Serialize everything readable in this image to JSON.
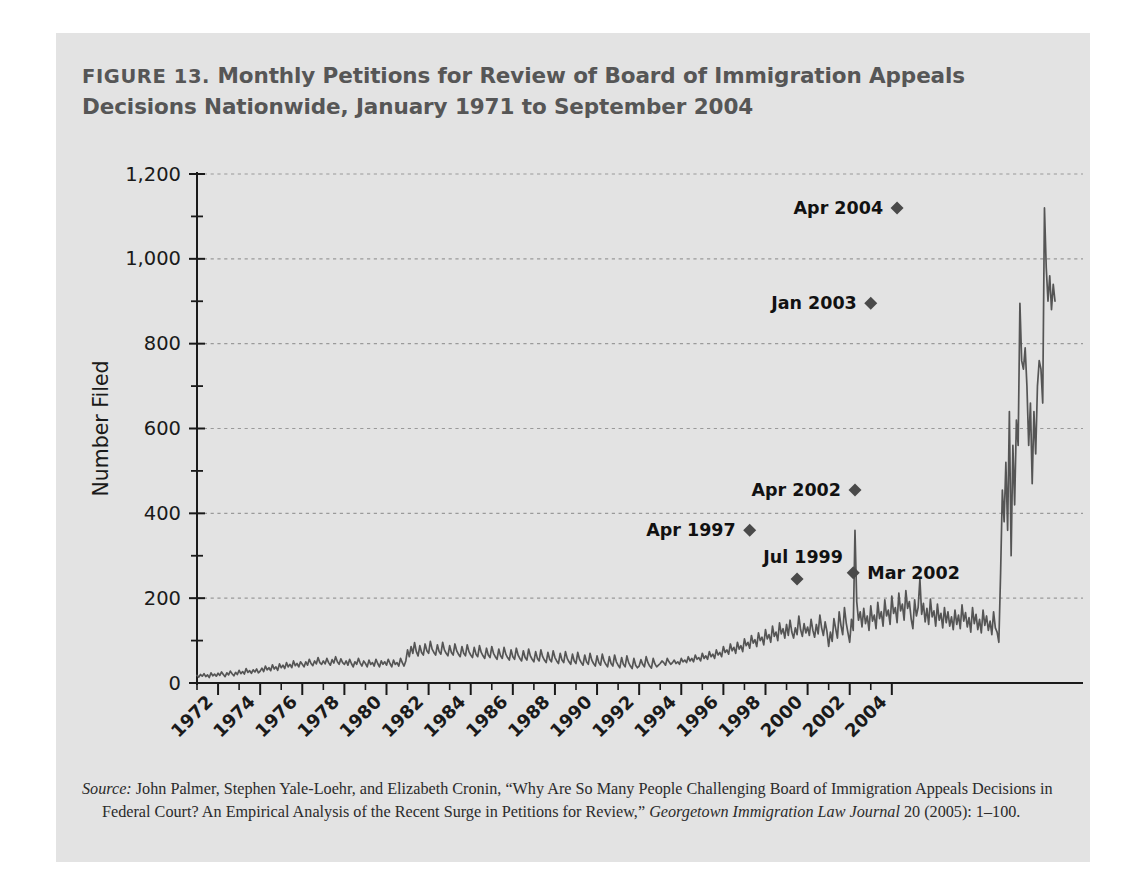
{
  "figure": {
    "label": "FIGURE 13.",
    "title_line1": "Monthly Petitions for Review of Board of Immigration Appeals",
    "title_line2": "Decisions Nationwide, January 1971 to September 2004",
    "title_full": "FIGURE 13. Monthly Petitions for Review of Board of Immigration Appeals Decisions Nationwide, January 1971 to September 2004"
  },
  "source": {
    "label": "Source:",
    "text_part1": " John Palmer, Stephen Yale-Loehr, and Elizabeth Cronin, “Why Are So Many People Challenging Board of Immigration Appeals Decisions in Federal Court? An Empirical Analysis of the Recent Surge in Petitions for Review,” ",
    "journal": "Georgetown Immigration Law Journal",
    "text_part2": " 20 (2005): 1–100."
  },
  "colors": {
    "page_background": "#ffffff",
    "panel_background": "#e3e3e3",
    "title_text": "#565656",
    "axis": "#1a1a1a",
    "gridline": "#9a9a9a",
    "series_line": "#555555",
    "marker": "#4a4a4a",
    "annotation_text": "#111111",
    "tick_label": "#1a1a1a",
    "source_text": "#2b2b2b"
  },
  "chart_data": {
    "type": "line",
    "title": "Monthly Petitions for Review of Board of Immigration Appeals Decisions Nationwide, January 1971 to September 2004",
    "xlabel": "",
    "ylabel": "Number Filed",
    "ylim": [
      0,
      1200
    ],
    "ytick_values": [
      0,
      200,
      400,
      600,
      800,
      1000,
      1200
    ],
    "ytick_labels": [
      "0",
      "200",
      "400",
      "600",
      "800",
      "1,000",
      "1,200"
    ],
    "yminor_tick_values": [
      100,
      300,
      500,
      700,
      900,
      1100
    ],
    "grid": "horizontal-dashed",
    "legend": "none",
    "xlim": [
      "1971-01",
      "2004-09"
    ],
    "xtick_labels": [
      "1972",
      "1974",
      "1976",
      "1978",
      "1980",
      "1982",
      "1984",
      "1986",
      "1988",
      "1990",
      "1992",
      "1994",
      "1996",
      "1998",
      "2000",
      "2002",
      "2004"
    ],
    "xtick_years": [
      1972,
      1974,
      1976,
      1978,
      1980,
      1982,
      1984,
      1986,
      1988,
      1990,
      1992,
      1994,
      1996,
      1998,
      2000,
      2002,
      2004
    ],
    "xminor_tick_years": [
      1971,
      1973,
      1975,
      1977,
      1979,
      1981,
      1983,
      1985,
      1987,
      1989,
      1991,
      1993,
      1995,
      1997,
      1999,
      2001,
      2003
    ],
    "x_tick_label_rotation_deg": 45,
    "annotations": [
      {
        "label": "Apr 1997",
        "x": "1997-04",
        "y": 360,
        "marker": "diamond",
        "label_side": "left"
      },
      {
        "label": "Jul 1999",
        "x": "1999-07",
        "y": 245,
        "marker": "diamond",
        "label_side": "above-left"
      },
      {
        "label": "Mar 2002",
        "x": "2002-03",
        "y": 260,
        "marker": "diamond",
        "label_side": "right"
      },
      {
        "label": "Apr 2002",
        "x": "2002-04",
        "y": 455,
        "marker": "diamond",
        "label_side": "left"
      },
      {
        "label": "Jan 2003",
        "x": "2003-01",
        "y": 895,
        "marker": "diamond",
        "label_side": "left"
      },
      {
        "label": "Apr 2004",
        "x": "2004-04",
        "y": 1120,
        "marker": "diamond",
        "label_side": "left"
      }
    ],
    "series": [
      {
        "name": "Petitions for Review Filed",
        "x_start": "1971-01",
        "x_step_months": 1,
        "values": [
          18,
          14,
          20,
          16,
          22,
          15,
          19,
          13,
          24,
          17,
          21,
          16,
          23,
          18,
          26,
          20,
          15,
          24,
          19,
          28,
          22,
          17,
          25,
          20,
          30,
          22,
          27,
          21,
          34,
          25,
          29,
          23,
          31,
          26,
          33,
          24,
          28,
          35,
          27,
          40,
          31,
          36,
          29,
          43,
          33,
          38,
          30,
          45,
          36,
          42,
          34,
          48,
          38,
          44,
          36,
          52,
          41,
          46,
          38,
          50,
          44,
          38,
          50,
          42,
          56,
          46,
          41,
          52,
          45,
          60,
          48,
          44,
          52,
          45,
          58,
          48,
          42,
          55,
          47,
          62,
          50,
          44,
          57,
          48,
          44,
          52,
          42,
          56,
          46,
          38,
          50,
          44,
          58,
          47,
          40,
          52,
          46,
          38,
          54,
          44,
          48,
          40,
          56,
          46,
          38,
          52,
          44,
          50,
          42,
          56,
          46,
          38,
          54,
          44,
          48,
          40,
          58,
          48,
          40,
          52,
          78,
          62,
          86,
          70,
          95,
          74,
          64,
          88,
          72,
          66,
          92,
          76,
          70,
          98,
          80,
          72,
          66,
          90,
          74,
          68,
          96,
          78,
          70,
          64,
          88,
          72,
          66,
          92,
          76,
          68,
          62,
          86,
          70,
          64,
          90,
          74,
          66,
          60,
          84,
          68,
          62,
          88,
          72,
          64,
          58,
          82,
          66,
          60,
          86,
          70,
          62,
          56,
          80,
          64,
          58,
          84,
          68,
          60,
          54,
          78,
          62,
          56,
          82,
          66,
          58,
          52,
          76,
          60,
          54,
          80,
          64,
          56,
          50,
          74,
          58,
          52,
          78,
          62,
          54,
          48,
          72,
          56,
          50,
          76,
          60,
          52,
          46,
          70,
          54,
          48,
          74,
          58,
          50,
          44,
          68,
          52,
          46,
          72,
          56,
          48,
          42,
          66,
          50,
          44,
          70,
          54,
          46,
          40,
          64,
          48,
          42,
          68,
          52,
          44,
          38,
          62,
          46,
          40,
          66,
          50,
          42,
          36,
          60,
          44,
          38,
          64,
          48,
          40,
          34,
          58,
          42,
          36,
          40,
          55,
          44,
          38,
          62,
          48,
          40,
          35,
          58,
          45,
          38,
          42,
          46,
          52,
          48,
          42,
          58,
          50,
          44,
          48,
          54,
          46,
          50,
          44,
          58,
          50,
          54,
          48,
          62,
          52,
          58,
          50,
          66,
          56,
          60,
          52,
          70,
          58,
          64,
          56,
          74,
          62,
          68,
          58,
          78,
          66,
          72,
          62,
          86,
          72,
          78,
          68,
          92,
          76,
          84,
          70,
          96,
          80,
          88,
          74,
          104,
          88,
          96,
          82,
          112,
          94,
          102,
          86,
          118,
          100,
          108,
          90,
          126,
          104,
          114,
          96,
          134,
          110,
          120,
          100,
          142,
          116,
          128,
          106,
          138,
          112,
          148,
          120,
          106,
          130,
          114,
          158,
          126,
          110,
          140,
          118,
          132,
          112,
          150,
          124,
          108,
          138,
          116,
          160,
          130,
          112,
          144,
          122,
          86,
          120,
          98,
          152,
          128,
          106,
          168,
          136,
          114,
          178,
          142,
          118,
          96,
          150,
          124,
          360,
          192,
          148,
          168,
          132,
          176,
          140,
          158,
          124,
          182,
          146,
          160,
          128,
          190,
          152,
          168,
          134,
          196,
          158,
          172,
          138,
          205,
          164,
          178,
          142,
          212,
          170,
          186,
          148,
          218,
          176,
          192,
          152,
          128,
          196,
          158,
          178,
          245,
          162,
          188,
          144,
          176,
          138,
          198,
          156,
          170,
          134,
          186,
          148,
          164,
          130,
          178,
          142,
          168,
          134,
          156,
          126,
          172,
          138,
          160,
          128,
          184,
          146,
          166,
          132,
          154,
          120,
          178,
          140,
          162,
          126,
          150,
          118,
          172,
          136,
          158,
          124,
          146,
          114,
          168,
          130,
          120,
          96,
          260,
          455,
          380,
          520,
          360,
          640,
          300,
          560,
          420,
          620,
          560,
          895,
          760,
          740,
          790,
          700,
          560,
          660,
          470,
          640,
          540,
          700,
          760,
          740,
          660,
          1120,
          980,
          900,
          960,
          880,
          940,
          900
        ]
      }
    ]
  }
}
